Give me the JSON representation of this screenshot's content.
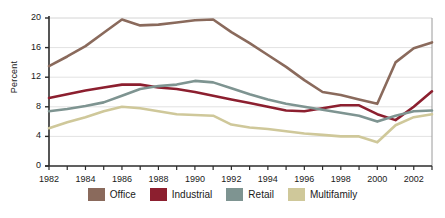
{
  "chart_data": {
    "type": "line",
    "title": "",
    "xlabel": "",
    "ylabel": "Percent",
    "x": [
      1982,
      1983,
      1984,
      1985,
      1986,
      1987,
      1988,
      1989,
      1990,
      1991,
      1992,
      1993,
      1994,
      1995,
      1996,
      1997,
      1998,
      1999,
      2000,
      2001,
      2002,
      2003
    ],
    "xlim": [
      1982,
      2003
    ],
    "ylim": [
      0,
      20
    ],
    "yticks": [
      0,
      4,
      8,
      12,
      16,
      20
    ],
    "ytick_labels": [
      "0",
      "4",
      "8",
      "12",
      "16",
      "20"
    ],
    "xtick_labels": [
      "1982",
      "1984",
      "1986",
      "1988",
      "1990",
      "1992",
      "1994",
      "1996",
      "1998",
      "2000",
      "2002"
    ],
    "xtick_values": [
      1982,
      1984,
      1986,
      1988,
      1990,
      1992,
      1994,
      1996,
      1998,
      2000,
      2002
    ],
    "grid": "horizontal",
    "legend_position": "bottom",
    "series": [
      {
        "name": "Office",
        "color": "#8a6a5c",
        "values": [
          13.5,
          14.8,
          16.2,
          18.0,
          19.8,
          19.0,
          19.1,
          19.4,
          19.7,
          19.8,
          18.1,
          16.6,
          15.0,
          13.4,
          11.6,
          10.0,
          9.6,
          9.0,
          8.4,
          14.0,
          15.9,
          16.7
        ]
      },
      {
        "name": "Industrial",
        "color": "#8c1f2f",
        "values": [
          9.2,
          9.7,
          10.2,
          10.6,
          11.0,
          11.0,
          10.6,
          10.4,
          10.0,
          9.5,
          9.0,
          8.5,
          8.0,
          7.5,
          7.4,
          7.8,
          8.2,
          8.2,
          7.0,
          6.2,
          8.0,
          10.1
        ]
      },
      {
        "name": "Retail",
        "color": "#7e9491",
        "values": [
          7.4,
          7.7,
          8.1,
          8.6,
          9.5,
          10.4,
          10.8,
          11.0,
          11.5,
          11.3,
          10.5,
          9.7,
          9.0,
          8.4,
          8.0,
          7.6,
          7.2,
          6.8,
          6.0,
          6.8,
          7.4,
          7.5
        ]
      },
      {
        "name": "Multifamily",
        "color": "#cfc89a",
        "values": [
          5.1,
          5.9,
          6.6,
          7.4,
          8.0,
          7.8,
          7.4,
          7.0,
          6.9,
          6.8,
          5.6,
          5.2,
          5.0,
          4.7,
          4.4,
          4.2,
          4.0,
          4.0,
          3.2,
          5.5,
          6.6,
          7.0
        ]
      }
    ]
  },
  "legend": {
    "items": [
      {
        "label": "Office",
        "color": "#8a6a5c"
      },
      {
        "label": "Industrial",
        "color": "#8c1f2f"
      },
      {
        "label": "Retail",
        "color": "#7e9491"
      },
      {
        "label": "Multifamily",
        "color": "#cfc89a"
      }
    ]
  },
  "axes": {
    "y_title": "Percent"
  }
}
